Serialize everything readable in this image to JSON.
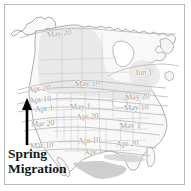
{
  "figure": {
    "caption_lines": [
      "Spring",
      "Migration"
    ],
    "frame_color": "#b9b9b9",
    "background_color": "#ffffff",
    "land_fill": "#f7f7f7",
    "shaded_region_fill": "#e4e4e4",
    "dark_region_fill": "#c8c8c8",
    "coastline_color": "#8e8e8e",
    "state_border_color": "#c2c2c2",
    "isoline_color": "#b0b0b0",
    "label_color": "#9a9a9a",
    "arrow_color": "#000000",
    "caption_color": "#161616"
  },
  "arrow": {
    "name": "spring-migration-direction-arrow",
    "direction": "north",
    "x": 27,
    "y_top": 99,
    "y_bottom": 144
  },
  "chart_data": {
    "type": "map",
    "units": "calendar date of spring arrival",
    "isoline_labels": [
      {
        "id": "l01",
        "text": "May 20",
        "x": 47,
        "y": 30,
        "rotate": -7
      },
      {
        "id": "l02",
        "text": "Jun 1",
        "x": 135,
        "y": 69,
        "rotate": -4
      },
      {
        "id": "l03",
        "text": "May 10",
        "x": 75,
        "y": 80,
        "rotate": -3
      },
      {
        "id": "l04",
        "text": "Apr 20",
        "x": 28,
        "y": 85,
        "rotate": -6
      },
      {
        "id": "l05",
        "text": "May 20",
        "x": 125,
        "y": 93,
        "rotate": -5
      },
      {
        "id": "l06",
        "text": "Apr 10",
        "x": 29,
        "y": 96,
        "rotate": -6
      },
      {
        "id": "l07",
        "text": "May 1",
        "x": 70,
        "y": 103,
        "rotate": -3
      },
      {
        "id": "l08",
        "text": "Apr 1",
        "x": 35,
        "y": 105,
        "rotate": -6
      },
      {
        "id": "l09",
        "text": "May 10",
        "x": 124,
        "y": 104,
        "rotate": -4
      },
      {
        "id": "l10",
        "text": "Apr 20",
        "x": 76,
        "y": 113,
        "rotate": -4
      },
      {
        "id": "l11",
        "text": "Mar 20",
        "x": 31,
        "y": 120,
        "rotate": -5
      },
      {
        "id": "l12",
        "text": "May 1",
        "x": 120,
        "y": 122,
        "rotate": -3
      },
      {
        "id": "l13",
        "text": "Apr 10",
        "x": 78,
        "y": 137,
        "rotate": -3
      },
      {
        "id": "l14",
        "text": "Apr 20",
        "x": 116,
        "y": 140,
        "rotate": -3
      },
      {
        "id": "l15",
        "text": "Mar 10",
        "x": 30,
        "y": 142,
        "rotate": -4
      },
      {
        "id": "l16",
        "text": "Apr 1",
        "x": 84,
        "y": 148,
        "rotate": -3
      }
    ],
    "annotations": [
      {
        "text": "Spring Migration",
        "role": "caption",
        "x": 8,
        "y": 146
      },
      {
        "text": "northward arrow",
        "role": "direction-indicator",
        "x": 27,
        "y": 120
      }
    ]
  }
}
